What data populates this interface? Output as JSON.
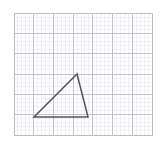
{
  "figure": {
    "background_color": "#ffffff",
    "width": 166,
    "height": 147
  },
  "grid": {
    "name": "graph-paper-grid",
    "x_min": 14,
    "y_min": 13,
    "x_max": 152,
    "y_max": 135,
    "major_columns": 7,
    "major_rows": 6,
    "minor_per_major": 5,
    "major_spacing_px": 19.71,
    "minor_spacing_px": 3.94,
    "major_color": "#b9bcc4",
    "minor_color": "#e6e8ec",
    "border_color": "#b9bcc4",
    "major_width": 0.9,
    "minor_width": 0.6
  },
  "chart_data": {
    "type": "scatter",
    "xlabel": "",
    "ylabel": "",
    "xlim": [
      0,
      7
    ],
    "ylim": [
      0,
      6
    ],
    "grid": true,
    "legend": "none",
    "shapes": [
      {
        "name": "triangle",
        "kind": "polygon",
        "closed": true,
        "stroke": "#555555",
        "stroke_width": 1.5,
        "fill": "none",
        "vertices_px": [
          {
            "label": "apex",
            "x": 77,
            "y": 74
          },
          {
            "label": "bottom-right",
            "x": 88,
            "y": 117
          },
          {
            "label": "bottom-left",
            "x": 34,
            "y": 117
          }
        ],
        "vertices_grid": [
          {
            "label": "apex",
            "x": 3.2,
            "y": 3.0
          },
          {
            "label": "bottom-right",
            "x": 3.75,
            "y": 0.9
          },
          {
            "label": "bottom-left",
            "x": 1.0,
            "y": 0.9
          }
        ]
      }
    ]
  }
}
